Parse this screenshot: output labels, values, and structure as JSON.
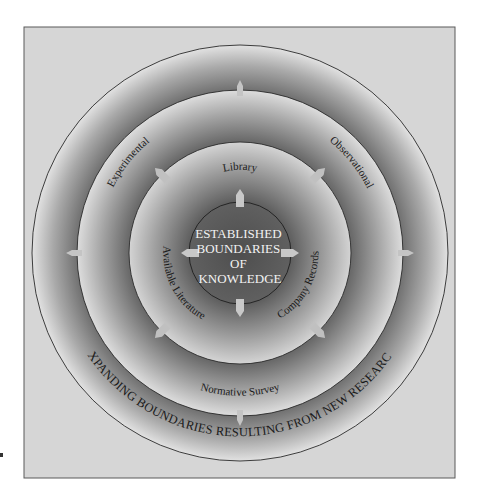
{
  "diagram": {
    "center_label": [
      "ESTABLISHED",
      "BOUNDARIES",
      "OF",
      "KNOWLEDGE"
    ],
    "inner_ring_labels": {
      "top": "Library",
      "lower_left": "Available Literature",
      "lower_right": "Company Records"
    },
    "middle_ring_labels": {
      "upper_left": "Experimental",
      "upper_right": "Observational",
      "bottom": "Normative Survey"
    },
    "outer_ring_label": "EXPANDING BOUNDARIES RESULTING FROM NEW RESEARCH",
    "arrows": {
      "inner": [
        "up",
        "down",
        "left",
        "right"
      ],
      "middle": [
        "upper-left",
        "upper-right",
        "lower-left",
        "lower-right"
      ],
      "outer": [
        "up",
        "down",
        "left",
        "right"
      ]
    },
    "colors": {
      "background": "#d6d6d6",
      "frame_border": "#5a5a5a",
      "ring_light": "#e4e4e4",
      "ring_dark": "#6e6e6e",
      "core": "#5c5c5c",
      "arrow_fill": "#c8c8c8",
      "circle_stroke": "#2a2a2a"
    }
  }
}
